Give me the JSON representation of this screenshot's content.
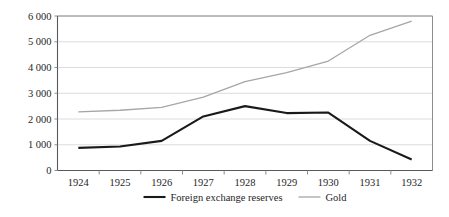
{
  "chart_data": {
    "type": "line",
    "title": "",
    "subtitle": "",
    "xlabel": "",
    "ylabel": "",
    "categories": [
      "1924",
      "1925",
      "1926",
      "1927",
      "1928",
      "1929",
      "1930",
      "1931",
      "1932"
    ],
    "series": [
      {
        "name": "Foreign exchange reserves",
        "color": "#1a1a1a",
        "width": 2.1,
        "values": [
          880,
          930,
          1150,
          2100,
          2500,
          2230,
          2250,
          1150,
          430
        ]
      },
      {
        "name": "Gold",
        "color": "#a6a6a6",
        "width": 1.3,
        "values": [
          2280,
          2340,
          2450,
          2850,
          3450,
          3800,
          4250,
          5250,
          5800
        ]
      }
    ],
    "ylim": [
      0,
      6000
    ],
    "ystep": 1000,
    "ytick_labels": [
      "0",
      "1 000",
      "2 000",
      "3 000",
      "4 000",
      "5 000",
      "6 000"
    ],
    "ytick_values": [
      0,
      1000,
      2000,
      3000,
      4000,
      5000,
      6000
    ],
    "grid": true,
    "grid_axis": "y",
    "legend_position": "bottom",
    "legend": [
      {
        "label": "Foreign exchange reserves",
        "color": "#1a1a1a",
        "width": 2.1
      },
      {
        "label": "Gold",
        "color": "#a6a6a6",
        "width": 1.3
      }
    ],
    "colors": {
      "background": "#ffffff",
      "gridline": "#d3d3d3",
      "axis": "#595959",
      "plot_border": "#808080",
      "text": "#262626"
    }
  }
}
